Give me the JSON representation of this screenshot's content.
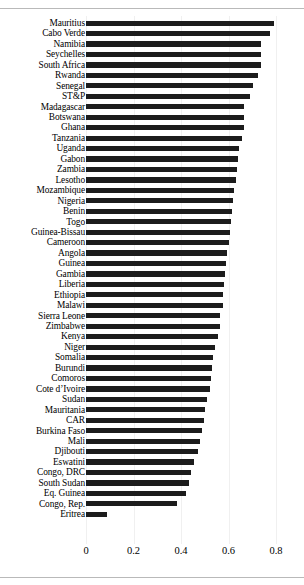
{
  "chart_data": {
    "type": "bar",
    "orientation": "horizontal",
    "title": "",
    "subtitle": "",
    "xlabel": "",
    "ylabel": "",
    "xlim": [
      0,
      0.88
    ],
    "xticks": [
      0,
      0.2,
      0.4,
      0.6,
      0.8
    ],
    "xtick_labels": [
      "0",
      "0.2",
      "0.4",
      "0.6",
      "0.8"
    ],
    "grid": true,
    "grid_axis": "x",
    "legend": false,
    "bar_color": "#1c1c1c",
    "sort": "descending",
    "categories": [
      "Mauritius",
      "Cabo Verde",
      "Namibia",
      "Seychelles",
      "South Africa",
      "Rwanda",
      "Senegal",
      "ST&P",
      "Madagascar",
      "Botswana",
      "Ghana",
      "Tanzania",
      "Uganda",
      "Gabon",
      "Zambia",
      "Lesotho",
      "Mozambique",
      "Nigeria",
      "Benin",
      "Togo",
      "Guinea-Bissau",
      "Cameroon",
      "Angola",
      "Guinea",
      "Gambia",
      "Liberia",
      "Ethiopia",
      "Malawi",
      "Sierra Leone",
      "Zimbabwe",
      "Kenya",
      "Niger",
      "Somalia",
      "Burundi",
      "Comoros",
      "Cote d’Ivoire",
      "Sudan",
      "Mauritania",
      "CAR",
      "Burkina Faso",
      "Mali",
      "Djibouti",
      "Eswatini",
      "Congo, DRC",
      "South Sudan",
      "Eq. Guinea",
      "Congo, Rep.",
      "Eritrea"
    ],
    "values": [
      0.79,
      0.775,
      0.735,
      0.735,
      0.735,
      0.725,
      0.705,
      0.69,
      0.665,
      0.665,
      0.665,
      0.655,
      0.645,
      0.64,
      0.635,
      0.63,
      0.625,
      0.62,
      0.615,
      0.61,
      0.605,
      0.6,
      0.595,
      0.59,
      0.585,
      0.58,
      0.575,
      0.575,
      0.565,
      0.565,
      0.555,
      0.545,
      0.535,
      0.53,
      0.525,
      0.52,
      0.51,
      0.5,
      0.495,
      0.49,
      0.48,
      0.47,
      0.455,
      0.44,
      0.435,
      0.42,
      0.385,
      0.09
    ]
  }
}
